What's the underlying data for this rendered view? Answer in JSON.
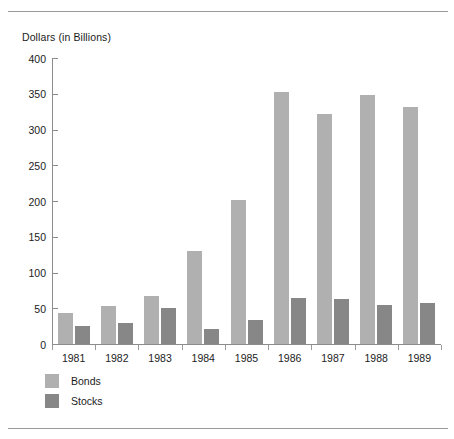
{
  "chart_data": {
    "type": "bar",
    "title": "",
    "ylabel": "Dollars (in Billions)",
    "xlabel": "",
    "ylim": [
      0,
      400
    ],
    "yticks": [
      0,
      50,
      100,
      150,
      200,
      250,
      300,
      350,
      400
    ],
    "ytick_labels": [
      "0",
      "50",
      "100",
      "150",
      "200",
      "250",
      "300",
      "350",
      "400"
    ],
    "grid": false,
    "legend_position": "bottom-left",
    "categories": [
      "1981",
      "1982",
      "1983",
      "1984",
      "1985",
      "1986",
      "1987",
      "1988",
      "1989"
    ],
    "series": [
      {
        "name": "Bonds",
        "color": "#b0b0b0",
        "values": [
          44,
          53,
          67,
          130,
          201,
          353,
          322,
          348,
          331
        ]
      },
      {
        "name": "Stocks",
        "color": "#878787",
        "values": [
          25,
          30,
          50,
          21,
          33,
          65,
          63,
          54,
          57
        ]
      }
    ]
  },
  "legend": {
    "items": [
      {
        "label": "Bonds",
        "color": "#b0b0b0"
      },
      {
        "label": "Stocks",
        "color": "#878787"
      }
    ]
  }
}
